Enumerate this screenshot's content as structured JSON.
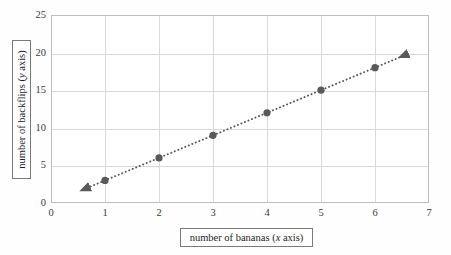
{
  "chart_data": {
    "type": "scatter",
    "title": "",
    "xlabel": "number of bananas (x axis)",
    "ylabel": "number of backflips (y axis)",
    "xlabel_parts": {
      "text": "number of bananas (",
      "italic": "x",
      "tail": " axis)"
    },
    "ylabel_parts": {
      "text": "number of backflips (",
      "italic": "y",
      "tail": " axis)"
    },
    "x": [
      1,
      2,
      3,
      4,
      5,
      6
    ],
    "values": [
      3,
      6,
      9,
      12,
      15,
      18
    ],
    "series": [
      {
        "name": "backflips per banana",
        "points": [
          {
            "x": 1,
            "y": 3
          },
          {
            "x": 2,
            "y": 6
          },
          {
            "x": 3,
            "y": 9
          },
          {
            "x": 4,
            "y": 12
          },
          {
            "x": 5,
            "y": 15
          },
          {
            "x": 6,
            "y": 18
          }
        ]
      }
    ],
    "trendline": {
      "style": "dotted",
      "arrow_start": {
        "x": 0.55,
        "y": 1.65
      },
      "arrow_end": {
        "x": 6.45,
        "y": 19.35
      },
      "slope": 3,
      "intercept": 0
    },
    "xlim": [
      0,
      7
    ],
    "ylim": [
      0,
      25
    ],
    "xticks": [
      "0",
      "1",
      "2",
      "3",
      "4",
      "5",
      "6",
      "7"
    ],
    "yticks": [
      "0",
      "5",
      "10",
      "15",
      "20",
      "25"
    ],
    "xtick_values": [
      0,
      1,
      2,
      3,
      4,
      5,
      6,
      7
    ],
    "ytick_values": [
      0,
      5,
      10,
      15,
      20,
      25
    ],
    "grid": true,
    "grid_x": [
      1,
      2,
      3,
      4,
      5,
      6
    ],
    "grid_y": [
      5,
      10,
      15,
      20
    ],
    "legend": null,
    "legend_position": "none",
    "colors": {
      "marker": "#595959",
      "line": "#595959",
      "grid": "#d9d9d9",
      "border": "#bfbfbf",
      "text": "#1d1d1d",
      "tick_text": "#3a3a3a",
      "box_border": "#7a7a7a",
      "background": "#ffffff"
    }
  }
}
